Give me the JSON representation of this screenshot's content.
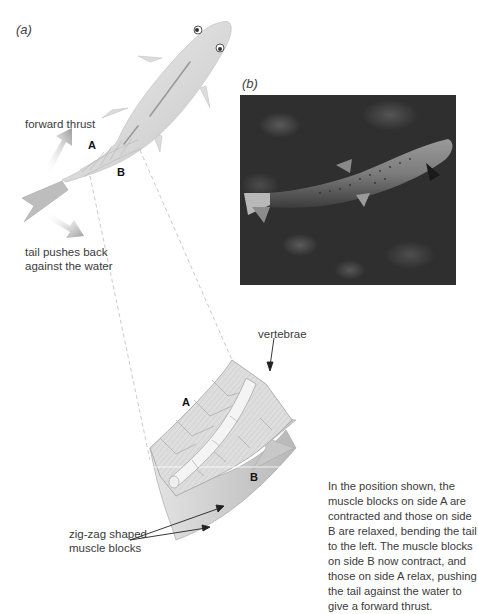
{
  "figure": {
    "panel_a": {
      "label": "(a)",
      "forward_thrust": "forward thrust",
      "tail_push": [
        "tail pushes back",
        "against the water"
      ],
      "side_a": "A",
      "side_b": "B"
    },
    "panel_b": {
      "label": "(b)",
      "photo_subject": "trout swimming underwater"
    },
    "detail": {
      "vertebrae": "vertebrae",
      "side_a": "A",
      "side_b": "B",
      "muscle_blocks": [
        "zig-zag shaped",
        "muscle blocks"
      ]
    },
    "caption": "In the position shown, the muscle blocks on side A are contracted and those on side B are relaxed, bending the tail to the left. The muscle blocks on side B now contract, and those on side A relax, pushing the tail against the water to give a forward thrust."
  },
  "colors": {
    "fish_body": "#d8d8d8",
    "arrow_grey": "#a8a8a8",
    "muscle_block": "#dcdcdc",
    "photo_bg": "#2f2f2f",
    "text": "#3a3a3a"
  }
}
